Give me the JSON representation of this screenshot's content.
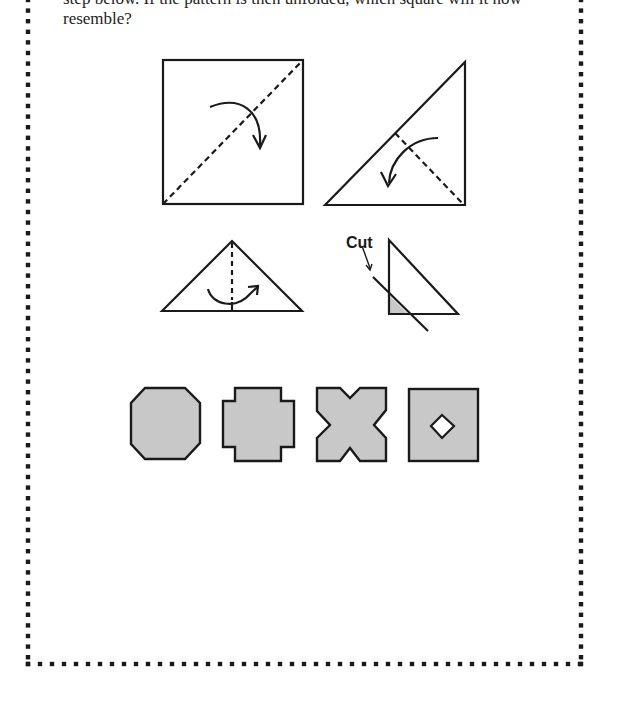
{
  "question": {
    "line1": "step below. If the pattern is then unfolded, which square will it now",
    "line2": "resemble?"
  },
  "steps": [
    {
      "id": 1,
      "description": "square with diagonal dashed fold line and curved arrow"
    },
    {
      "id": 2,
      "description": "triangle folded in half along dashed line"
    },
    {
      "id": 3,
      "description": "smaller triangle with vertical dashed fold line"
    },
    {
      "id": 4,
      "description": "right triangle with cut line",
      "label": "Cut"
    }
  ],
  "options": [
    {
      "id": "A",
      "shape": "octagon"
    },
    {
      "id": "B",
      "shape": "plus-square"
    },
    {
      "id": "C",
      "shape": "x-notched-square"
    },
    {
      "id": "D",
      "shape": "square-with-diamond-hole"
    }
  ],
  "colors": {
    "stroke": "#1a1a1a",
    "fill": "#c8c8c8",
    "border_dots": "#1a1a1a"
  }
}
